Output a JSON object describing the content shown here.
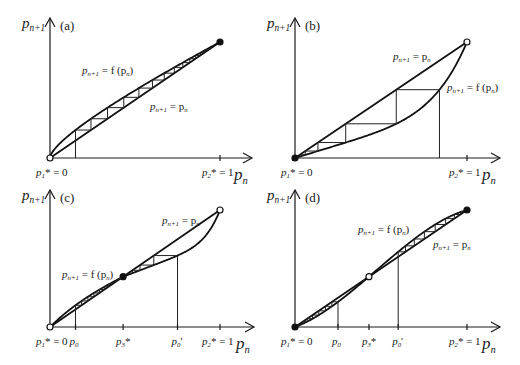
{
  "figure": {
    "panels": [
      {
        "id": "a",
        "label": "(a)",
        "y_axis_label": "p",
        "y_axis_sub": "n+1",
        "x_axis_label": "p",
        "x_axis_sub": "n",
        "curve_label": "p_{n+1} = f(p_n)",
        "curve_label_text": [
          "p",
          "n+1",
          " = f (p",
          "n",
          ")"
        ],
        "diag_label_text": [
          "p",
          "n+1",
          " = p",
          "n"
        ],
        "fixed_points": [
          {
            "x": 0,
            "name": "p1*",
            "text": [
              "p",
              "1",
              "* = 0"
            ],
            "marker": "open"
          },
          {
            "x": 1,
            "name": "p2*",
            "text": [
              "p",
              "2",
              "* = 1"
            ],
            "marker": "filled"
          }
        ],
        "curve_type": "concave",
        "start_points": [
          0.15
        ],
        "ticks": []
      },
      {
        "id": "b",
        "label": "(b)",
        "y_axis_label": "p",
        "y_axis_sub": "n+1",
        "x_axis_label": "p",
        "x_axis_sub": "n",
        "curve_label_text": [
          "p",
          "n+1",
          " = f (p",
          "n",
          ")"
        ],
        "diag_label_text": [
          "p",
          "n+1",
          " = p",
          "n"
        ],
        "fixed_points": [
          {
            "x": 0,
            "name": "p1*",
            "text": [
              "p",
              "1",
              "* = 0"
            ],
            "marker": "filled"
          },
          {
            "x": 1,
            "name": "p2*",
            "text": [
              "p",
              "2",
              "* = 1"
            ],
            "marker": "open"
          }
        ],
        "curve_type": "convex",
        "start_points": [
          0.84
        ],
        "ticks": []
      },
      {
        "id": "c",
        "label": "(c)",
        "y_axis_label": "p",
        "y_axis_sub": "n+1",
        "x_axis_label": "p",
        "x_axis_sub": "n",
        "curve_label_text": [
          "p",
          "n+1",
          " = f (p",
          "n",
          ")"
        ],
        "diag_label_text": [
          "p",
          "n+1",
          " = p",
          "n"
        ],
        "fixed_points": [
          {
            "x": 0,
            "name": "p1*",
            "text": [
              "p",
              "1",
              "* = 0"
            ],
            "marker": "open"
          },
          {
            "x": 0.43,
            "name": "p3*",
            "text": [
              "p",
              "3",
              "*"
            ],
            "marker": "filled"
          },
          {
            "x": 1,
            "name": "p2*",
            "text": [
              "p",
              "2",
              "* = 1"
            ],
            "marker": "open"
          }
        ],
        "curve_type": "stable-interior",
        "start_points": [
          0.15,
          0.75
        ],
        "ticks": [
          {
            "x": 0.15,
            "text": [
              "p",
              "0",
              ""
            ]
          },
          {
            "x": 0.75,
            "text": [
              "p",
              "0",
              "'"
            ]
          }
        ]
      },
      {
        "id": "d",
        "label": "(d)",
        "y_axis_label": "p",
        "y_axis_sub": "n+1",
        "x_axis_label": "p",
        "x_axis_sub": "n",
        "curve_label_text": [
          "p",
          "n+1",
          " = f (p",
          "n",
          ")"
        ],
        "diag_label_text": [
          "p",
          "n+1",
          " = p",
          "n"
        ],
        "fixed_points": [
          {
            "x": 0,
            "name": "p1*",
            "text": [
              "p",
              "1",
              "* = 0"
            ],
            "marker": "filled"
          },
          {
            "x": 0.43,
            "name": "p3*",
            "text": [
              "p",
              "3",
              "*"
            ],
            "marker": "open"
          },
          {
            "x": 1,
            "name": "p2*",
            "text": [
              "p",
              "2",
              "* = 1"
            ],
            "marker": "filled"
          }
        ],
        "curve_type": "unstable-interior",
        "start_points": [
          0.25,
          0.6
        ],
        "ticks": [
          {
            "x": 0.25,
            "text": [
              "p",
              "0",
              ""
            ]
          },
          {
            "x": 0.6,
            "text": [
              "p",
              "0",
              "'"
            ]
          }
        ]
      }
    ]
  }
}
